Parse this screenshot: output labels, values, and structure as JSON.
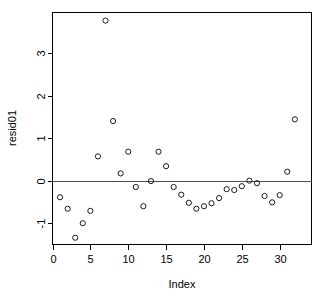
{
  "chart_data": {
    "type": "scatter",
    "title": "",
    "xlabel": "Index",
    "ylabel": "resid01",
    "xlim": [
      0,
      34.2
    ],
    "ylim": [
      -1.5,
      3.95
    ],
    "grid": false,
    "legend": null,
    "xticks": [
      0,
      5,
      10,
      15,
      20,
      25,
      30
    ],
    "xticklabels": [
      "0",
      "5",
      "10",
      "15",
      "20",
      "25",
      "30"
    ],
    "yticks": [
      -1,
      0,
      1,
      2,
      3
    ],
    "yticklabels": [
      "-1",
      "0",
      "1",
      "2",
      "3"
    ],
    "marker": "open-circle",
    "reference_lines": [
      {
        "orientation": "horizontal",
        "value": 0,
        "color": "#4d4d4d"
      }
    ],
    "x": [
      1,
      2,
      3,
      4,
      5,
      6,
      7,
      8,
      9,
      10,
      11,
      12,
      13,
      14,
      15,
      16,
      17,
      18,
      19,
      20,
      21,
      22,
      23,
      24,
      25,
      26,
      27,
      28,
      29,
      30,
      31,
      32
    ],
    "values": [
      -0.39,
      -0.66,
      -1.34,
      -1.0,
      -0.71,
      0.57,
      3.76,
      1.4,
      0.17,
      0.68,
      -0.15,
      -0.6,
      -0.01,
      0.68,
      0.34,
      -0.15,
      -0.33,
      -0.52,
      -0.66,
      -0.6,
      -0.53,
      -0.41,
      -0.2,
      -0.22,
      -0.13,
      0.0,
      -0.06,
      -0.36,
      -0.51,
      -0.34,
      0.21,
      1.44
    ],
    "series": [
      {
        "name": "resid01",
        "x": [
          1,
          2,
          3,
          4,
          5,
          6,
          7,
          8,
          9,
          10,
          11,
          12,
          13,
          14,
          15,
          16,
          17,
          18,
          19,
          20,
          21,
          22,
          23,
          24,
          25,
          26,
          27,
          28,
          29,
          30,
          31,
          32
        ],
        "values": [
          -0.39,
          -0.66,
          -1.34,
          -1.0,
          -0.71,
          0.57,
          3.76,
          1.4,
          0.17,
          0.68,
          -0.15,
          -0.6,
          -0.01,
          0.68,
          0.34,
          -0.15,
          -0.33,
          -0.52,
          -0.66,
          -0.6,
          -0.53,
          -0.41,
          -0.2,
          -0.22,
          -0.13,
          0.0,
          -0.06,
          -0.36,
          -0.51,
          -0.34,
          0.21,
          1.44
        ]
      }
    ]
  },
  "colors": {
    "marker_stroke": "#1a1a1a",
    "axis": "#000000",
    "zero_line": "#4d4d4d",
    "background": "#ffffff"
  }
}
